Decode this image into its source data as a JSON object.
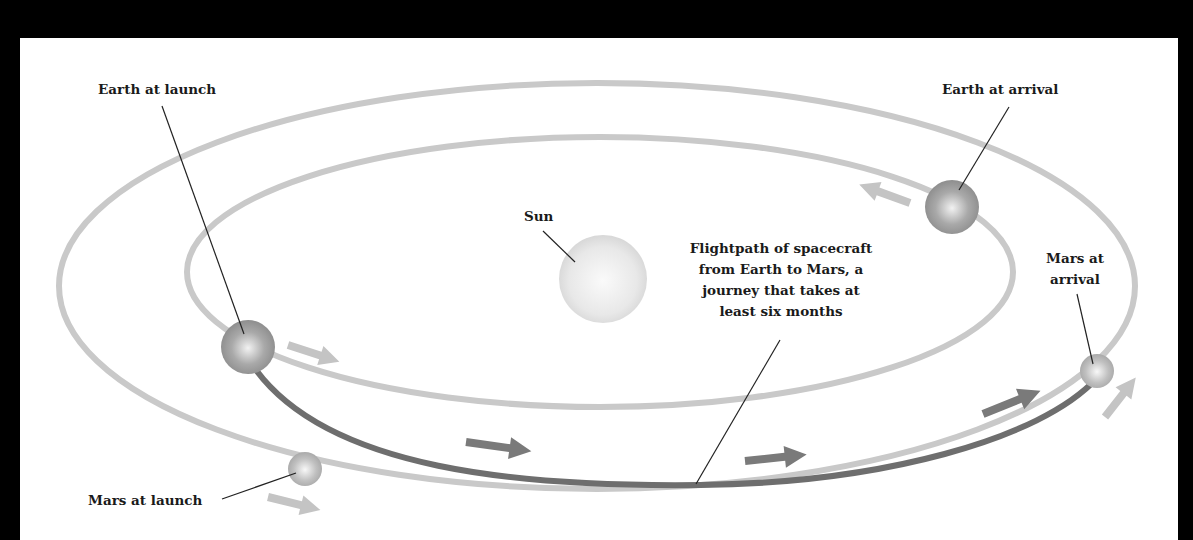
{
  "diagram": {
    "labels": {
      "earth_launch": "Earth at launch",
      "earth_arrival": "Earth at arrival",
      "sun": "Sun",
      "flightpath": [
        "Flightpath of spacecraft",
        "from Earth to Mars, a",
        "journey that takes at",
        "least six months"
      ],
      "mars_arrival": [
        "Mars at",
        "arrival"
      ],
      "mars_launch": "Mars at launch"
    },
    "colors": {
      "background": "#000000",
      "panel": "#ffffff",
      "orbit": "#c9c9c9",
      "flightpath": "#6e6e6e",
      "flight_arrows": "#7a7a7a",
      "orbit_arrows": "#c4c4c4",
      "text": "#1a1a1a"
    },
    "bodies": [
      {
        "name": "Sun",
        "cx": 603,
        "cy": 279,
        "r": 44
      },
      {
        "name": "Earth at launch",
        "cx": 248,
        "cy": 347,
        "r": 27
      },
      {
        "name": "Earth at arrival",
        "cx": 952,
        "cy": 207,
        "r": 27
      },
      {
        "name": "Mars at launch",
        "cx": 305,
        "cy": 469,
        "r": 17
      },
      {
        "name": "Mars at arrival",
        "cx": 1097,
        "cy": 371,
        "r": 17
      }
    ]
  }
}
